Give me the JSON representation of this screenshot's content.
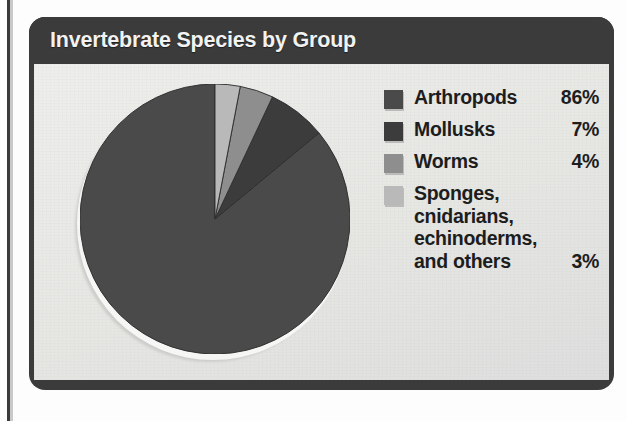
{
  "figure": {
    "title": "Invertebrate Species by Group",
    "header_bg": "#3b3b3b",
    "title_color": "#f2f2f2",
    "body_bg": "#e9e9e7"
  },
  "chart_data": {
    "type": "pie",
    "title": "Invertebrate Species by Group",
    "xlabel": "",
    "ylabel": "",
    "unit": "%",
    "legend_position": "right",
    "grid": false,
    "start_angle_deg": 0,
    "direction": "counterclockwise",
    "categories": [
      "Arthropods",
      "Mollusks",
      "Worms",
      "Sponges, cnidarians, echinoderms, and others"
    ],
    "values": [
      86,
      7,
      4,
      3
    ],
    "labels": [
      "86%",
      "7%",
      "4%",
      "3%"
    ],
    "colors": [
      "#4a4a4a",
      "#3c3c3c",
      "#8e8e8e",
      "#b9b9b9"
    ],
    "slices": [
      {
        "name": "Arthropods",
        "value": 86,
        "label": "86%",
        "color": "#4a4a4a"
      },
      {
        "name": "Mollusks",
        "value": 7,
        "label": "7%",
        "color": "#3c3c3c"
      },
      {
        "name": "Worms",
        "value": 4,
        "label": "4%",
        "color": "#8e8e8e"
      },
      {
        "name": "Sponges, cnidarians, echinoderms, and others",
        "value": 3,
        "label": "3%",
        "color": "#b9b9b9"
      }
    ]
  },
  "legend": {
    "items": [
      {
        "label": "Arthropods",
        "value": "86%",
        "color": "#4a4a4a",
        "multiline": false
      },
      {
        "label": "Mollusks",
        "value": "7%",
        "color": "#3c3c3c",
        "multiline": false
      },
      {
        "label": "Worms",
        "value": "4%",
        "color": "#8e8e8e",
        "multiline": false
      },
      {
        "label": "Sponges,\ncnidarians,\nechinoderms,\nand others",
        "value": "3%",
        "color": "#b9b9b9",
        "multiline": true
      }
    ]
  }
}
